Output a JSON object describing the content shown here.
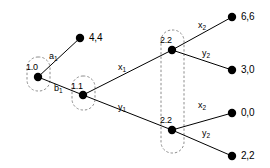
{
  "figure": {
    "kind": "extensive-form-game-tree",
    "background_color": "#ffffff",
    "line_color": "#000000",
    "node_fill_color": "#000000",
    "infoset_border_color": "#808080"
  },
  "nodes": [
    {
      "id": "root",
      "label": "1.0",
      "x": 38,
      "y": 77,
      "label_x": 26,
      "label_y": 63,
      "in_infoset": "is-1-0"
    },
    {
      "id": "n-1-1",
      "label": "1.1",
      "x": 83,
      "y": 95,
      "label_x": 71,
      "label_y": 82,
      "in_infoset": "is-1-1"
    },
    {
      "id": "n-2-2-up",
      "label": "2.2",
      "x": 172,
      "y": 50,
      "label_x": 160,
      "label_y": 36,
      "in_infoset": "is-2-2"
    },
    {
      "id": "n-2-2-dn",
      "label": "2.2",
      "x": 172,
      "y": 130,
      "label_x": 160,
      "label_y": 116,
      "in_infoset": "is-2-2"
    }
  ],
  "terminals": [
    {
      "id": "t-4-4",
      "payoff": "4,4",
      "x": 80,
      "y": 38,
      "label_x": 89,
      "label_y": 33
    },
    {
      "id": "t-6-6",
      "payoff": "6,6",
      "x": 232,
      "y": 17,
      "label_x": 241,
      "label_y": 12
    },
    {
      "id": "t-3-0",
      "payoff": "3,0",
      "x": 232,
      "y": 70,
      "label_x": 241,
      "label_y": 65
    },
    {
      "id": "t-0-0",
      "payoff": "0,0",
      "x": 232,
      "y": 113,
      "label_x": 241,
      "label_y": 108
    },
    {
      "id": "t-2-2",
      "payoff": "2,2",
      "x": 232,
      "y": 156,
      "label_x": 241,
      "label_y": 151
    }
  ],
  "edges": [
    {
      "id": "e-a1",
      "from": "root",
      "to": "t-4-4",
      "label_base": "a",
      "label_sub": "1",
      "label_x": 49,
      "label_y": 52
    },
    {
      "id": "e-b1",
      "from": "root",
      "to": "n-1-1",
      "label_base": "b",
      "label_sub": "1",
      "label_x": 54,
      "label_y": 84
    },
    {
      "id": "e-x1",
      "from": "n-1-1",
      "to": "n-2-2-up",
      "label_base": "x",
      "label_sub": "1",
      "label_x": 118,
      "label_y": 63
    },
    {
      "id": "e-y1",
      "from": "n-1-1",
      "to": "n-2-2-dn",
      "label_base": "y",
      "label_sub": "1",
      "label_x": 118,
      "label_y": 103
    },
    {
      "id": "e-x2u",
      "from": "n-2-2-up",
      "to": "t-6-6",
      "label_base": "x",
      "label_sub": "2",
      "label_x": 198,
      "label_y": 21
    },
    {
      "id": "e-y2u",
      "from": "n-2-2-up",
      "to": "t-3-0",
      "label_base": "y",
      "label_sub": "2",
      "label_x": 202,
      "label_y": 49
    },
    {
      "id": "e-x2d",
      "from": "n-2-2-dn",
      "to": "t-0-0",
      "label_base": "x",
      "label_sub": "2",
      "label_x": 198,
      "label_y": 101
    },
    {
      "id": "e-y2d",
      "from": "n-2-2-dn",
      "to": "t-2-2",
      "label_base": "y",
      "label_sub": "2",
      "label_x": 202,
      "label_y": 129
    }
  ],
  "infosets": [
    {
      "id": "is-1-0",
      "owner": "1.0",
      "x": 27,
      "y": 57,
      "w": 23,
      "h": 34,
      "r": 11
    },
    {
      "id": "is-1-1",
      "owner": "1.1",
      "x": 72,
      "y": 76,
      "w": 23,
      "h": 34,
      "r": 11
    },
    {
      "id": "is-2-2",
      "owner": "2.2",
      "x": 161,
      "y": 30,
      "w": 23,
      "h": 123,
      "r": 11
    }
  ]
}
